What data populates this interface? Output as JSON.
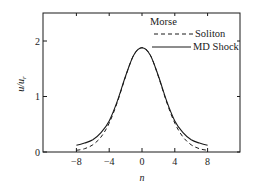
{
  "chart_data": {
    "type": "line",
    "title": "",
    "legend_title": "Morse",
    "xlabel": "n",
    "ylabel": "u/u_r",
    "xlim": [
      -11,
      13
    ],
    "ylim": [
      0,
      2.5
    ],
    "xticks": [
      -8,
      -4,
      0,
      4,
      8
    ],
    "yticks": [
      0,
      1,
      2
    ],
    "grid": false,
    "legend_position": "upper right",
    "series": [
      {
        "name": "Soliton",
        "style": "dashed",
        "x": [
          -8,
          -7,
          -6,
          -5,
          -4,
          -3,
          -2,
          -1,
          0,
          1,
          2,
          3,
          4,
          5,
          6,
          7,
          8
        ],
        "y": [
          0.03,
          0.06,
          0.13,
          0.27,
          0.52,
          0.9,
          1.36,
          1.75,
          1.88,
          1.75,
          1.36,
          0.9,
          0.52,
          0.27,
          0.13,
          0.06,
          0.03
        ]
      },
      {
        "name": "MD Shock",
        "style": "solid",
        "x": [
          -8,
          -7,
          -6,
          -5,
          -4,
          -3,
          -2,
          -1,
          0,
          1,
          2,
          3,
          4,
          5,
          6,
          7,
          8
        ],
        "y": [
          0.12,
          0.16,
          0.22,
          0.35,
          0.56,
          0.92,
          1.37,
          1.75,
          1.88,
          1.75,
          1.37,
          0.92,
          0.56,
          0.35,
          0.22,
          0.16,
          0.12
        ]
      }
    ]
  },
  "labels": {
    "legend_title": "Morse",
    "legend_soliton": "Soliton",
    "legend_md": "MD Shock",
    "xlabel": "n",
    "ylabel": "u/u",
    "ylabel_sub": "r",
    "xtick_labels": [
      "−8",
      "−4",
      "0",
      "4",
      "8"
    ],
    "ytick_labels": [
      "0",
      "1",
      "2"
    ]
  }
}
